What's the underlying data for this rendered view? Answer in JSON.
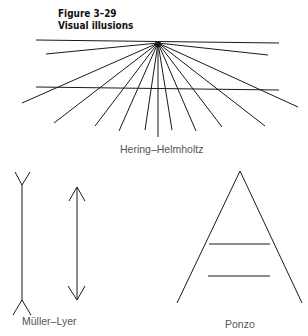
{
  "figure": {
    "number": "Figure 3–29",
    "title": "Visual illusions"
  },
  "illusions": [
    {
      "name": "Hering–Helmholtz"
    },
    {
      "name": "Müller–Lyer"
    },
    {
      "name": "Ponzo"
    }
  ],
  "colors": {
    "ink": "#1a1a1a",
    "label": "#555555",
    "background": "#ffffff"
  }
}
